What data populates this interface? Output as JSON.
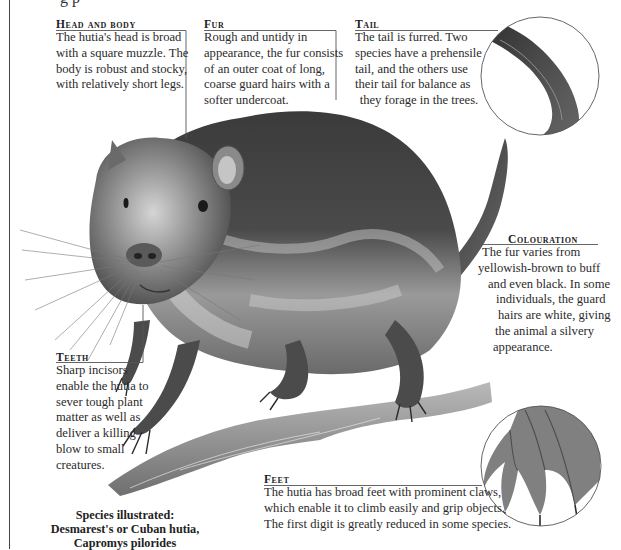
{
  "page": {
    "cut_off_title": "g    p",
    "species_block": {
      "line1": "Species illustrated:",
      "line2": "Desmarest's or Cuban hutia,",
      "line3": "Capromys pilorides"
    }
  },
  "callouts": {
    "head_and_body": {
      "heading": "Head and body",
      "text": "The hutia's head is broad with a square muzzle. The body is robust and stocky, with relatively short legs."
    },
    "fur": {
      "heading": "Fur",
      "text": "Rough and untidy in appearance, the fur consists of an outer coat of long, coarse guard hairs with a softer undercoat."
    },
    "tail": {
      "heading": "Tail",
      "text": "The tail is furred. Two species have a prehensile tail, and the others use their tail for balance as they forage in the trees."
    },
    "colouration": {
      "heading": "Colouration",
      "lines": [
        "The fur varies from",
        "yellowish-brown to buff",
        "and even black. In some",
        "individuals, the guard",
        "hairs are white, giving",
        "the animal a silvery",
        "appearance."
      ]
    },
    "teeth": {
      "heading": "Teeth",
      "text": "Sharp incisors enable the hutia to sever tough plant matter as well as deliver a killing blow to small creatures."
    },
    "feet": {
      "heading": "Feet",
      "lines": [
        "The hutia has broad feet with prominent claws,",
        "which enable it to climb easily and grip objects.",
        "The first digit is greatly reduced in some species."
      ]
    }
  },
  "illustration": {
    "subject": "hutia-on-branch",
    "insets": [
      "tail-closeup",
      "foot-closeup"
    ],
    "colors": {
      "ink": "#2a2a2a",
      "fur_dark": "#3a3a3a",
      "fur_mid": "#7a7a7a",
      "fur_light": "#c9c9c9",
      "branch": "#8d8d8d",
      "leader_line": "#555555"
    }
  }
}
